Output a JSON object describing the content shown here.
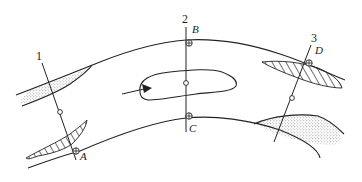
{
  "diagram": {
    "type": "cross-section-channel-bend",
    "section_lines": [
      {
        "label": "1"
      },
      {
        "label": "2"
      },
      {
        "label": "3"
      }
    ],
    "points": [
      {
        "label": "A"
      },
      {
        "label": "B"
      },
      {
        "label": "C"
      },
      {
        "label": "D"
      }
    ],
    "regions": {
      "dotted_deposits": [
        "upper-left bank deposit",
        "lower-right bank deposit"
      ],
      "hatched_erosion": [
        "lower-left bank erosion",
        "upper-right bank erosion"
      ],
      "central_island": "mid-channel bar with flow arrow"
    },
    "colors": {
      "line": "#222222",
      "stipple": "#9a9a9a",
      "background": "#ffffff"
    }
  }
}
